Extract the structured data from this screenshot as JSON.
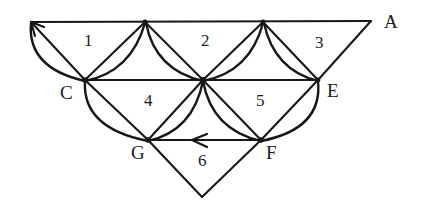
{
  "figure": {
    "stroke_color": "#17171a",
    "background_color": "#ffffff",
    "width": 421,
    "height": 209
  },
  "point_labels": [
    {
      "id": "A",
      "text": "A",
      "x": 384,
      "y": 12
    },
    {
      "id": "C",
      "text": "C",
      "x": 60,
      "y": 83
    },
    {
      "id": "E",
      "text": "E",
      "x": 327,
      "y": 81
    },
    {
      "id": "G",
      "text": "G",
      "x": 131,
      "y": 143
    },
    {
      "id": "F",
      "text": "F",
      "x": 266,
      "y": 143
    }
  ],
  "region_labels": [
    {
      "id": "r1",
      "text": "1",
      "x": 84,
      "y": 32
    },
    {
      "id": "r2",
      "text": "2",
      "x": 201,
      "y": 32
    },
    {
      "id": "r3",
      "text": "3",
      "x": 315,
      "y": 34
    },
    {
      "id": "r4",
      "text": "4",
      "x": 144,
      "y": 92
    },
    {
      "id": "r5",
      "text": "5",
      "x": 256,
      "y": 92
    },
    {
      "id": "r6",
      "text": "6",
      "x": 198,
      "y": 152
    }
  ],
  "vertices": {
    "top_left_arrow_tip": {
      "x": 31,
      "y": 22
    },
    "top_mid_left": {
      "x": 145,
      "y": 22
    },
    "top_mid_right": {
      "x": 263,
      "y": 22
    },
    "A": {
      "x": 371,
      "y": 21
    },
    "C": {
      "x": 85,
      "y": 80
    },
    "D": {
      "x": 203,
      "y": 80
    },
    "E": {
      "x": 318,
      "y": 80
    },
    "G": {
      "x": 148,
      "y": 140
    },
    "F": {
      "x": 261,
      "y": 140
    },
    "bottom_apex": {
      "x": 202,
      "y": 197
    }
  },
  "arrows": [
    {
      "id": "top-left-arrow",
      "direction": "up-left",
      "tip_x": 31,
      "tip_y": 22
    },
    {
      "id": "fg-arrow",
      "direction": "left",
      "tip_x": 192,
      "tip_y": 140
    }
  ]
}
